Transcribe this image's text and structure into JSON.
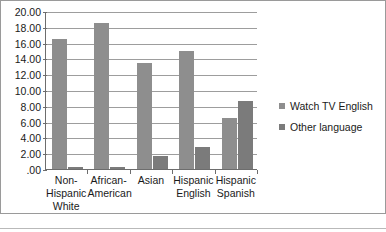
{
  "chart_data": {
    "type": "bar",
    "title": "",
    "subtitle": "",
    "xlabel": "",
    "ylabel": "",
    "ylim": [
      0,
      20
    ],
    "ytick_step": 2,
    "grid": true,
    "legend_position": "right",
    "categories": [
      "Non-\nHispanic\nWhite",
      "African-\nAmerican",
      "Asian",
      "Hispanic\nEnglish",
      "Hispanic\nSpanish"
    ],
    "ytick_labels": [
      "20.00",
      "18.00",
      "16.00",
      "14.00",
      "12.00",
      "10.00",
      "8.00",
      "6.00",
      "4.00",
      "2.00",
      ".00"
    ],
    "ytick_values": [
      20,
      18,
      16,
      14,
      12,
      10,
      8,
      6,
      4,
      2,
      0
    ],
    "series": [
      {
        "name": "Watch TV English",
        "color": "#8e8e8e",
        "values": [
          16.5,
          18.5,
          13.4,
          14.9,
          6.5
        ]
      },
      {
        "name": "Other language",
        "color": "#7b7b7b",
        "values": [
          0.2,
          0.3,
          1.6,
          2.8,
          8.6
        ]
      }
    ]
  }
}
